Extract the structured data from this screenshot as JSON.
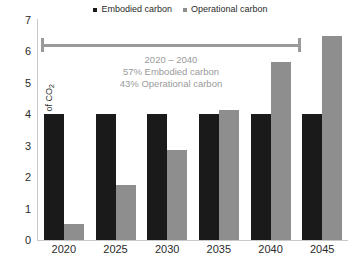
{
  "legend": {
    "items": [
      {
        "label": "Embodied carbon",
        "color": "#1a1a1a",
        "marker": "square-marker-icon"
      },
      {
        "label": "Operational carbon",
        "color": "#8e8e8e",
        "marker": "square-marker-icon"
      }
    ]
  },
  "annotation": {
    "range_start_year": "2020",
    "range_end_year": "2040",
    "line1": "2020 – 2040",
    "line2": "57% Embodied carbon",
    "line3": "43% Operational carbon",
    "color": "#9a9a9a"
  },
  "chart_data": {
    "type": "bar",
    "title": "",
    "subtitle": "",
    "xlabel": "",
    "ylabel": "Gigatons of CO₂",
    "categories": [
      "2020",
      "2025",
      "2030",
      "2035",
      "2040",
      "2045"
    ],
    "series": [
      {
        "name": "Embodied carbon",
        "color": "#1a1a1a",
        "values": [
          4.0,
          4.0,
          4.0,
          4.0,
          4.0,
          4.0
        ]
      },
      {
        "name": "Operational carbon",
        "color": "#8e8e8e",
        "values": [
          0.5,
          1.75,
          2.85,
          4.15,
          5.65,
          6.5
        ]
      }
    ],
    "ylim": [
      0,
      7
    ],
    "yticks": [
      7,
      6,
      5,
      4,
      3,
      2,
      1,
      0
    ],
    "ytick_labels": [
      "7",
      "6",
      "5",
      "4",
      "3",
      "2",
      "1",
      "0"
    ],
    "grid": false,
    "legend_position": "top-center",
    "annotations": [
      {
        "type": "range-bracket",
        "from": "2020",
        "to": "2040",
        "text": [
          "2020 – 2040",
          "57% Embodied carbon",
          "43% Operational carbon"
        ]
      }
    ]
  }
}
